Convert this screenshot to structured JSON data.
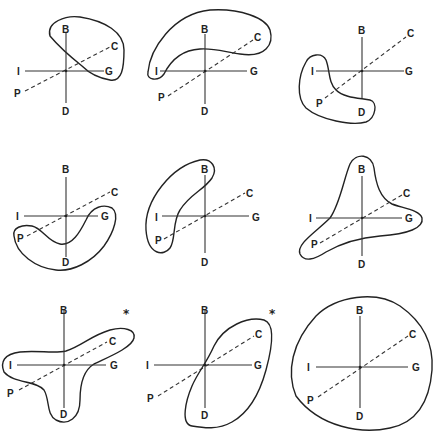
{
  "figure": {
    "type": "3x3 grid of axis diagrams with enclosing contours",
    "axis_labels": {
      "up": "B",
      "down": "D",
      "left": "I",
      "right": "G",
      "diag_upper": "C",
      "diag_lower": "P"
    },
    "panels": [
      {
        "id": 1,
        "row": 1,
        "col": 1,
        "marker": ""
      },
      {
        "id": 2,
        "row": 1,
        "col": 2,
        "marker": ""
      },
      {
        "id": 3,
        "row": 1,
        "col": 3,
        "marker": ""
      },
      {
        "id": 4,
        "row": 2,
        "col": 1,
        "marker": ""
      },
      {
        "id": 5,
        "row": 2,
        "col": 2,
        "marker": ""
      },
      {
        "id": 6,
        "row": 2,
        "col": 3,
        "marker": ""
      },
      {
        "id": 7,
        "row": 3,
        "col": 1,
        "marker": "*"
      },
      {
        "id": 8,
        "row": 3,
        "col": 2,
        "marker": "*"
      },
      {
        "id": 9,
        "row": 3,
        "col": 3,
        "marker": ""
      }
    ]
  }
}
